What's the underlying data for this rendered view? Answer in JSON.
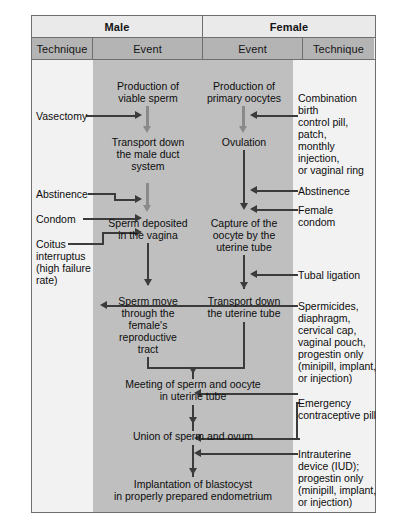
{
  "diagram": {
    "colors": {
      "band": "#bfbfbf",
      "page": "#f2f2f2",
      "subheader": "#b4b4b4",
      "sexheader": "#eaeaea",
      "line": "#3b3b3b",
      "grey_arrow": "#8a8a8a",
      "border": "#6e6e6e"
    }
  },
  "header": {
    "sex": [
      {
        "label": "Male"
      },
      {
        "label": "Female"
      }
    ],
    "columns": [
      {
        "label": "Technique"
      },
      {
        "label": "Event"
      },
      {
        "label": "Event"
      },
      {
        "label": "Technique"
      }
    ]
  },
  "male_events": [
    {
      "id": "viable-sperm",
      "label": "Production of\nviable sperm",
      "line1": "Production of",
      "line2": "viable sperm"
    },
    {
      "id": "male-duct-transport",
      "label": "Transport down\nthe  male duct\nsystem",
      "line1": "Transport down",
      "line2": "the  male duct",
      "line3": "system"
    },
    {
      "id": "sperm-deposited",
      "label": "Sperm deposited\nin the vagina",
      "line1": "Sperm deposited",
      "line2": "in the vagina"
    },
    {
      "id": "sperm-move",
      "label": "Sperm move\nthrough the\nfemale's\nreproductive\ntract",
      "line1": "Sperm move",
      "line2": "through the",
      "line3": "female's",
      "line4": "reproductive",
      "line5": "tract"
    }
  ],
  "female_events": [
    {
      "id": "primary-oocytes",
      "label": "Production of\nprimary oocytes",
      "line1": "Production of",
      "line2": "primary oocytes"
    },
    {
      "id": "ovulation",
      "label": "Ovulation",
      "line1": "Ovulation"
    },
    {
      "id": "oocyte-capture",
      "label": "Capture of the\noocyte by the\nuterine tube",
      "line1": "Capture of the",
      "line2": "oocyte by the",
      "line3": "uterine tube"
    },
    {
      "id": "uterine-transport",
      "label": "Transport down\nthe uterine tube",
      "line1": "Transport down",
      "line2": "the uterine tube"
    }
  ],
  "shared_events": [
    {
      "id": "meeting",
      "line1": "Meeting of sperm and oocyte",
      "line2": "in uterine tube"
    },
    {
      "id": "union",
      "line1": "Union of sperm and ovum"
    },
    {
      "id": "implantation",
      "line1": "Implantation of blastocyst",
      "line2": "in properly prepared endometrium"
    }
  ],
  "male_techniques": [
    {
      "id": "vasectomy",
      "line1": "Vasectomy"
    },
    {
      "id": "abstinence-male",
      "line1": "Abstinence"
    },
    {
      "id": "condom",
      "line1": "Condom"
    },
    {
      "id": "coitus-interruptus",
      "line1": "Coitus",
      "line2": "interruptus",
      "line3": "(high failure",
      "line4": "rate)"
    }
  ],
  "female_techniques": [
    {
      "id": "combination-pill",
      "line1": "Combination birth",
      "line2": "control pill, patch,",
      "line3": "monthly injection,",
      "line4": "or vaginal ring"
    },
    {
      "id": "abstinence-female",
      "line1": "Abstinence"
    },
    {
      "id": "female-condom",
      "line1": "Female",
      "line2": "condom"
    },
    {
      "id": "tubal-ligation",
      "line1": "Tubal ligation"
    },
    {
      "id": "spermicides",
      "line1": "Spermicides,",
      "line2": "diaphragm,",
      "line3": "cervical cap,",
      "line4": "vaginal pouch,",
      "line5": "progestin only",
      "line6": "(minipill, implant,",
      "line7": "or injection)"
    },
    {
      "id": "emergency-pill",
      "line1": "Emergency",
      "line2": "contraceptive pill"
    },
    {
      "id": "iud",
      "line1": "Intrauterine",
      "line2": "device (IUD);",
      "line3": "progestin only",
      "line4": "(minipill, implant,",
      "line5": "or injection)"
    }
  ]
}
